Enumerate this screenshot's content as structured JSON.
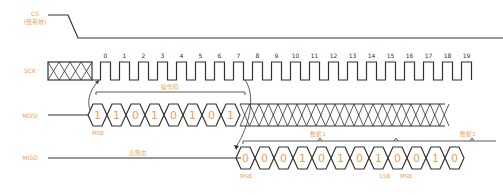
{
  "signals": {
    "cs": {
      "label": "CS",
      "sublabel": "(低有效)"
    },
    "sck": {
      "label": "SCK"
    },
    "mosi": {
      "label": "MOSI"
    },
    "miso": {
      "label": "MISO"
    }
  },
  "clock": {
    "tick_labels": [
      "0",
      "1",
      "2",
      "3",
      "4",
      "5",
      "6",
      "7",
      "8",
      "9",
      "10",
      "11",
      "12",
      "13",
      "14",
      "15",
      "16",
      "17",
      "18",
      "19"
    ]
  },
  "mosi": {
    "bits": [
      "1",
      "1",
      "0",
      "1",
      "0",
      "1",
      "0",
      "1"
    ],
    "group_label": "操作码",
    "msb_label": "MSB"
  },
  "miso": {
    "idle_label": "高阻态",
    "bits": [
      "0",
      "0",
      "0",
      "1",
      "0",
      "1",
      "0",
      "1",
      "0",
      "0",
      "1",
      "0"
    ],
    "group1_label": "数据1",
    "group2_label": "数据2",
    "msb_label": "MSB",
    "lsb_label": "LSB",
    "msb2_label": "MSB"
  },
  "colors": {
    "label": "#f0a050",
    "line": "#333333"
  }
}
